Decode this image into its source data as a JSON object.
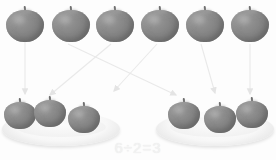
{
  "figure": {
    "equation": "6÷2=3",
    "background_color": "#fdfdfd",
    "apple_color": "#898989",
    "plate_color": "#f7f7f7",
    "arrow_color": "#e9e9e9",
    "equation_color": "#f2f2f2"
  },
  "source_row": {
    "label": "top-row-apples",
    "count": 6,
    "apples": [
      {
        "label": "apple-1",
        "x": 6,
        "y": 6
      },
      {
        "label": "apple-2",
        "x": 52,
        "y": 6
      },
      {
        "label": "apple-3",
        "x": 96,
        "y": 6
      },
      {
        "label": "apple-4",
        "x": 141,
        "y": 6
      },
      {
        "label": "apple-5",
        "x": 186,
        "y": 6
      },
      {
        "label": "apple-6",
        "x": 231,
        "y": 6
      }
    ]
  },
  "groups": [
    {
      "label": "left-plate-group",
      "count": 3,
      "plate": {
        "x": 2,
        "y": 112
      },
      "apples": [
        {
          "label": "left-apple-1",
          "x": 4,
          "y": 98
        },
        {
          "label": "left-apple-2",
          "x": 34,
          "y": 96
        },
        {
          "label": "left-apple-3",
          "x": 68,
          "y": 102
        }
      ]
    },
    {
      "label": "right-plate-group",
      "count": 3,
      "plate": {
        "x": 156,
        "y": 112
      },
      "apples": [
        {
          "label": "right-apple-1",
          "x": 168,
          "y": 98
        },
        {
          "label": "right-apple-2",
          "x": 204,
          "y": 102
        },
        {
          "label": "right-apple-3",
          "x": 236,
          "y": 97
        }
      ]
    }
  ],
  "arrows": [
    {
      "label": "arrow-apple1-to-left-plate",
      "x1": 25,
      "y1": 42,
      "x2": 25,
      "y2": 94
    },
    {
      "label": "arrow-apple2-to-right-plate",
      "x1": 68,
      "y1": 44,
      "x2": 176,
      "y2": 95
    },
    {
      "label": "arrow-apple3-to-left-plate",
      "x1": 111,
      "y1": 44,
      "x2": 50,
      "y2": 95
    },
    {
      "label": "arrow-apple4-to-left-plate",
      "x1": 157,
      "y1": 44,
      "x2": 114,
      "y2": 91
    },
    {
      "label": "arrow-apple5-to-right-plate",
      "x1": 201,
      "y1": 44,
      "x2": 215,
      "y2": 93
    },
    {
      "label": "arrow-apple6-to-right-plate",
      "x1": 250,
      "y1": 44,
      "x2": 250,
      "y2": 94
    }
  ]
}
